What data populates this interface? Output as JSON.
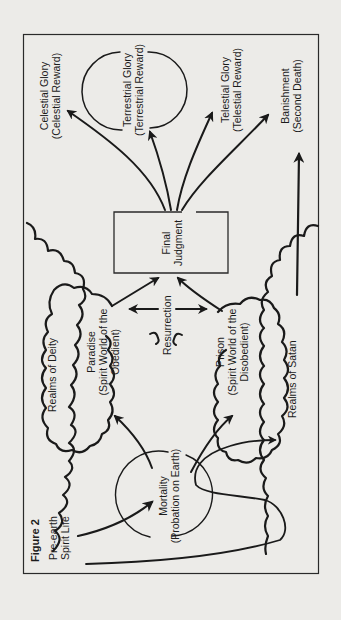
{
  "figure": {
    "title": "Figure 2",
    "orientation": "rotated 90° counter-clockwise",
    "background_color": "#ecebe8",
    "ink_color": "#1a1a1a"
  },
  "labels": {
    "pre_earth": [
      "Pre-earth",
      "Spirit Life"
    ],
    "mortality": [
      "Mortality",
      "(Probation on Earth)"
    ],
    "realms_of_deity": "Realms of Deity",
    "realms_of_satan": "Realms of Satan",
    "paradise": [
      "Paradise",
      "(Spirit World of the",
      "Obedient)"
    ],
    "prison": [
      "Prison",
      "(Spirit World of the",
      "Disobedient)"
    ],
    "resurrection": "Resurrection",
    "final_judgment": [
      "Final",
      "Judgment"
    ],
    "celestial": [
      "Celestial Glory",
      "(Celestial Reward)"
    ],
    "terrestrial": [
      "Terrestrial Glory",
      "(Terrestrial Reward)"
    ],
    "telestial": [
      "Telestial Glory",
      "(Telestial Reward)"
    ],
    "banishment": [
      "Banishment",
      "(Second Death)"
    ]
  },
  "flow": [
    {
      "from": "Pre-earth Spirit Life",
      "to": "Mortality"
    },
    {
      "from": "Mortality",
      "to": "Paradise"
    },
    {
      "from": "Mortality",
      "to": "Prison"
    },
    {
      "from": "Mortality",
      "to": "Realms of Satan"
    },
    {
      "from": "Paradise",
      "to": "Final Judgment"
    },
    {
      "from": "Prison",
      "to": "Final Judgment"
    },
    {
      "from": "Paradise",
      "to": "Prison",
      "label": "Resurrection",
      "bidirectional": true
    },
    {
      "from": "Final Judgment",
      "to": "Celestial Glory"
    },
    {
      "from": "Final Judgment",
      "to": "Terrestrial Glory"
    },
    {
      "from": "Final Judgment",
      "to": "Telestial Glory"
    },
    {
      "from": "Final Judgment",
      "to": "Banishment"
    },
    {
      "from": "Realms of Satan",
      "to": "Banishment"
    }
  ]
}
